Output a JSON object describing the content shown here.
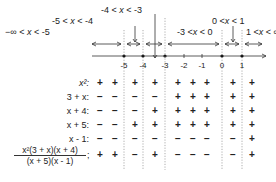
{
  "interval_labels": [
    {
      "text": "-∞ < x < -5",
      "x": 5,
      "y": 27
    },
    {
      "text": "-5 < x < -4",
      "x": 52,
      "y": 16
    },
    {
      "text": "-4 < x < -3",
      "x": 101,
      "y": 5
    },
    {
      "text": "-3 < x < 0",
      "x": 177,
      "y": 27
    },
    {
      "text": "0 < x < 1",
      "x": 212,
      "y": 16
    },
    {
      "text": "1 < x < ∞",
      "x": 238,
      "y": 27
    }
  ],
  "number_line": {
    "ticks": [
      {
        "label": "-5",
        "x": 124
      },
      {
        "label": "-4",
        "x": 143
      },
      {
        "label": "-3",
        "x": 165
      },
      {
        "label": "-2",
        "x": 184
      },
      {
        "label": "-1",
        "x": 202
      },
      {
        "label": "0",
        "x": 222
      },
      {
        "label": "1",
        "x": 242
      }
    ],
    "critical_points": [
      -5,
      -4,
      -3,
      0,
      1
    ]
  },
  "columns_x": [
    100,
    115,
    135,
    155,
    178,
    193,
    207,
    233,
    252
  ],
  "rows": [
    {
      "label": "x²:",
      "signs": [
        "+",
        "+",
        "+",
        "+",
        "+",
        "+",
        "+",
        "+",
        "+"
      ]
    },
    {
      "label": "3 + x:",
      "signs": [
        "−",
        "−",
        "−",
        "−",
        "+",
        "+",
        "+",
        "+",
        "+"
      ]
    },
    {
      "label": "x + 4:",
      "signs": [
        "−",
        "−",
        "−",
        "+",
        "+",
        "+",
        "+",
        "+",
        "+"
      ]
    },
    {
      "label": "x + 5:",
      "signs": [
        "−",
        "−",
        "+",
        "+",
        "+",
        "+",
        "+",
        "+",
        "+"
      ]
    },
    {
      "label": "x - 1:",
      "signs": [
        "−",
        "−",
        "−",
        "−",
        "−",
        "−",
        "−",
        "−",
        "+"
      ]
    }
  ],
  "result_row": {
    "numerator": "x²(3 + x)(x + 4)",
    "denominator": "(x + 5)(x - 1)",
    "signs": [
      "+",
      "+",
      "−",
      "+",
      "−",
      "−",
      "−",
      "−",
      "+"
    ]
  }
}
